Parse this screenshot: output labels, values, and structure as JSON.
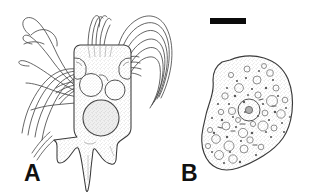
{
  "figure": {
    "type": "scientific-line-drawing",
    "background_color": "#ffffff",
    "ink_color": "#3a3a3a",
    "label_color": "#111111",
    "width": 317,
    "height": 196,
    "panels": [
      {
        "id": "A",
        "label": "A",
        "label_x": 24,
        "label_y": 162,
        "subject": "suctorian-ciliate-with-tentacle-bundles",
        "description": "Vase-shaped cell body with stippled cytoplasm, two upper contractile vacuoles, one large lower macronucleus, pointed posterior spine with lateral projections, and two arcing bundles of tentacles emerging from the anterior left and right shoulders.",
        "features": [
          "left-tentacle-bundle",
          "right-tentacle-bundle",
          "cell-body",
          "upper-left-vacuole",
          "upper-right-vacuole",
          "macronucleus",
          "posterior-spine"
        ]
      },
      {
        "id": "B",
        "label": "B",
        "label_x": 181,
        "label_y": 162,
        "subject": "amoeboid-cell-with-granular-cytoplasm",
        "description": "Bean- or kidney-shaped cell outline filled with fine stippling and numerous small circular vacuoles and granules; a single larger nucleus containing a central nucleolus lies in the upper-left quadrant.",
        "features": [
          "cell-outline",
          "nucleus",
          "nucleolus",
          "cytoplasmic-vacuoles",
          "granules"
        ]
      }
    ],
    "scale_bar": {
      "name": "scale-bar",
      "x": 210,
      "y": 18,
      "width": 36,
      "height": 6,
      "color": "#0b0b0b",
      "caption": ""
    }
  }
}
